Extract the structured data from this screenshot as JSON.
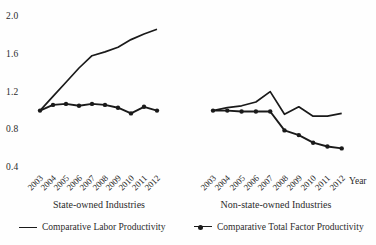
{
  "colors": {
    "line": "#1a1a1a",
    "text": "#2b2b2b",
    "background": "#fefefe"
  },
  "chart_data": {
    "type": "line",
    "title": "",
    "xlabel": "Year",
    "ylabel": "",
    "ylim": [
      0.4,
      2.0
    ],
    "grid": false,
    "legend_position": "bottom",
    "ytick_labels": [
      "2.0",
      "1.6",
      "1.2",
      "0.8",
      "0.4"
    ],
    "categories": [
      "2003",
      "2004",
      "2005",
      "2006",
      "2007",
      "2008",
      "2009",
      "2010",
      "2011",
      "2012"
    ],
    "panels": [
      {
        "label": "State-owned Industries",
        "series": [
          {
            "name": "Comparative Labor Productivity",
            "style": "solid",
            "values": [
              1.0,
              1.15,
              1.3,
              1.45,
              1.58,
              1.62,
              1.67,
              1.75,
              1.81,
              1.86
            ]
          },
          {
            "name": "Comparative Total Factor Productivity",
            "style": "solid-markers",
            "values": [
              1.0,
              1.06,
              1.07,
              1.05,
              1.07,
              1.06,
              1.03,
              0.97,
              1.04,
              1.0
            ]
          }
        ]
      },
      {
        "label": "Non-state-owned Industries",
        "series": [
          {
            "name": "Comparative Labor Productivity",
            "style": "solid",
            "values": [
              1.0,
              1.03,
              1.05,
              1.09,
              1.2,
              0.96,
              1.04,
              0.94,
              0.94,
              0.97
            ]
          },
          {
            "name": "Comparative Total Factor Productivity",
            "style": "solid-markers",
            "values": [
              1.0,
              1.0,
              0.99,
              0.99,
              0.99,
              0.79,
              0.74,
              0.66,
              0.62,
              0.6
            ]
          }
        ]
      }
    ],
    "legend": [
      {
        "label": "Comparative Labor Productivity",
        "marker": false
      },
      {
        "label": "Comparative Total Factor Productivity",
        "marker": true
      }
    ]
  }
}
